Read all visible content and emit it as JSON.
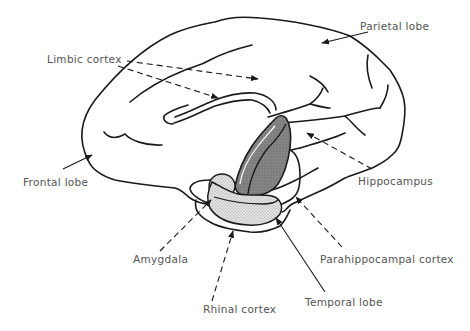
{
  "diagram": {
    "type": "anatomical-line-drawing",
    "colors": {
      "outline": "#1a1a1a",
      "label_text": "#555555",
      "hippocampus_fill": "#7a7a7a",
      "stipple_fill": "#d6d6d6",
      "background": "#ffffff"
    },
    "labels": {
      "parietal_lobe": "Parietal lobe",
      "limbic_cortex": "Limbic cortex",
      "frontal_lobe": "Frontal lobe",
      "hippocampus": "Hippocampus",
      "amygdala": "Amygdala",
      "parahippocampal_cortex": "Parahippocampal cortex",
      "rhinal_cortex": "Rhinal cortex",
      "temporal_lobe": "Temporal lobe"
    },
    "leaders": [
      {
        "label": "Parietal lobe",
        "style": "solid",
        "arrow": true
      },
      {
        "label": "Limbic cortex",
        "style": "dashed",
        "arrow": true,
        "count": 2
      },
      {
        "label": "Frontal lobe",
        "style": "solid",
        "arrow": true
      },
      {
        "label": "Hippocampus",
        "style": "dashed",
        "arrow": true
      },
      {
        "label": "Amygdala",
        "style": "dashed",
        "arrow": true
      },
      {
        "label": "Parahippocampal cortex",
        "style": "dashed",
        "arrow": true
      },
      {
        "label": "Rhinal cortex",
        "style": "dashed",
        "arrow": true
      },
      {
        "label": "Temporal lobe",
        "style": "solid",
        "arrow": true
      }
    ]
  }
}
